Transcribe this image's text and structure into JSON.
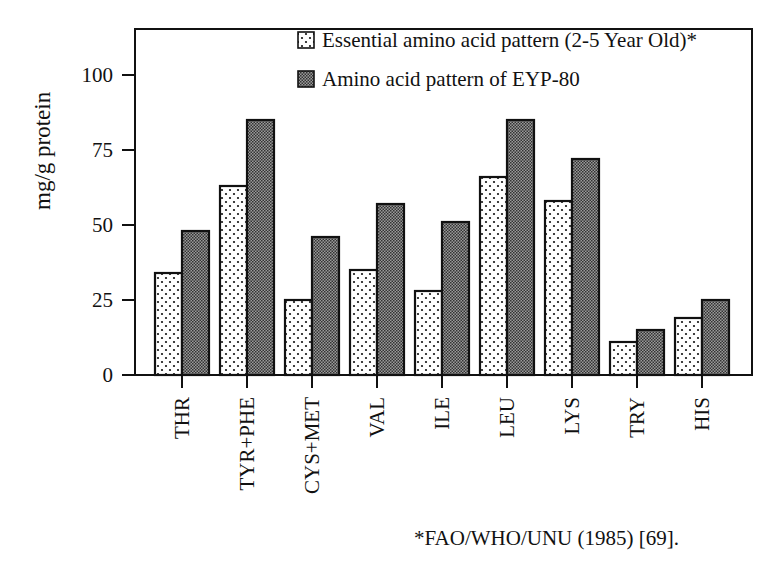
{
  "chart_data": {
    "type": "bar",
    "title": "",
    "xlabel": "",
    "ylabel": "mg/g protein",
    "ylim": [
      0,
      115
    ],
    "yticks": [
      0,
      25,
      50,
      75,
      100
    ],
    "grid": false,
    "legend_position": "top-right inside",
    "categories": [
      "THR",
      "TYR+PHE",
      "CYS+MET",
      "VAL",
      "ILE",
      "LEU",
      "LYS",
      "TRY",
      "HIS"
    ],
    "series": [
      {
        "name": "Essential amino acid pattern (2-5 Year Old)*",
        "pattern": "dotted",
        "values": [
          34,
          63,
          25,
          35,
          28,
          66,
          58,
          11,
          19
        ]
      },
      {
        "name": "Amino acid pattern of EYP-80",
        "pattern": "dense-cross-hatch",
        "values": [
          48,
          85,
          46,
          57,
          51,
          85,
          72,
          15,
          25
        ]
      }
    ],
    "footnote": "*FAO/WHO/UNU (1985) [69]."
  },
  "colors": {
    "ink": "#111111",
    "background": "#ffffff",
    "dark_fill": "#7a7a7a"
  }
}
